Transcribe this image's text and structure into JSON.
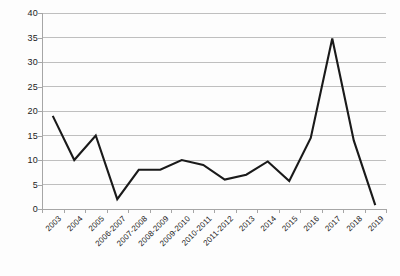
{
  "chart_data": {
    "type": "line",
    "title": "",
    "subtitle": "",
    "xlabel": "",
    "ylabel": "",
    "categories": [
      "2003",
      "2004",
      "2005",
      "2006-2007",
      "2007-2008",
      "2008-2009",
      "2009-2010",
      "2010-2011",
      "2011-2012",
      "2013",
      "2014",
      "2015",
      "2016",
      "2017",
      "2018",
      "2019"
    ],
    "values": [
      19,
      10,
      15,
      2,
      8,
      8,
      10,
      9,
      6,
      7,
      9.7,
      5.7,
      14.5,
      34.8,
      14,
      0.8
    ],
    "series": [
      {
        "name": "series-1",
        "values": [
          19,
          10,
          15,
          2,
          8,
          8,
          10,
          9,
          6,
          7,
          9.7,
          5.7,
          14.5,
          34.8,
          14,
          0.8
        ],
        "color": "#1a1a1a"
      }
    ],
    "ylim": [
      0,
      40
    ],
    "y_ticks": [
      0,
      5,
      10,
      15,
      20,
      25,
      30,
      35,
      40
    ],
    "y_tick_labels": [
      "0",
      "5",
      "10",
      "15",
      "20",
      "25",
      "30",
      "35",
      "40"
    ],
    "grid": true,
    "grid_axis": "y",
    "grid_color": "#bfbfbf",
    "legend": false,
    "legend_position": "none",
    "axis_color": "#a6a6a6",
    "background_color": "#fdfdfd",
    "xtick_rotation": -45
  }
}
